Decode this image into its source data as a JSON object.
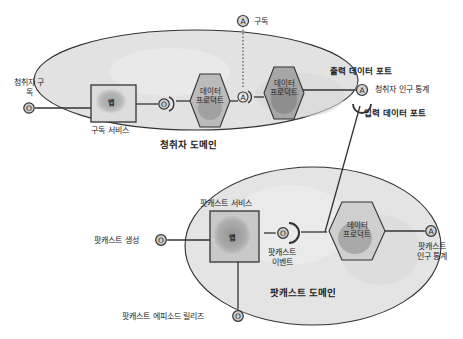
{
  "diagram": {
    "domains": [
      {
        "id": "listener",
        "label": "청취자 도메인",
        "app": {
          "label": "앱",
          "service_label": "구독 서비스"
        },
        "input_port": {
          "symbol": "O",
          "label": "청취자 구독"
        },
        "internal_port_1": {
          "symbol": "O"
        },
        "data_products": [
          {
            "line1": "데이터",
            "line2": "프로덕트"
          },
          {
            "line1": "데이터",
            "line2": "프로덕트"
          }
        ],
        "internal_port_2": {
          "symbol": "A"
        },
        "external_output": {
          "symbol": "A",
          "label": "구독"
        },
        "output_port": {
          "symbol": "A",
          "caption": "출력 데이터 포트",
          "label": "청취자 인구 통계"
        },
        "input_data_port_caption": "입력 데이터 포트"
      },
      {
        "id": "podcast",
        "label": "팟캐스트 도메인",
        "app": {
          "label": "앱",
          "service_label": "팟캐스트 서비스"
        },
        "input_port_create": {
          "symbol": "O",
          "label": "팟캐스트 생성"
        },
        "input_port_release": {
          "symbol": "O",
          "label": "팟캐스트 에피소드 릴리즈"
        },
        "event_port": {
          "symbol": "O",
          "label_line1": "팟캐스트",
          "label_line2": "이벤트"
        },
        "data_product": {
          "line1": "데이터",
          "line2": "프로덕트"
        },
        "output_port": {
          "symbol": "A",
          "label_line1": "팟캐스트",
          "label_line2": "인구 통계"
        }
      }
    ],
    "colors": {
      "domain_fill": "#e4e4e4",
      "shape_fill": "#9a9a9a",
      "stroke": "#333333",
      "port_glow": "#bdbdbd"
    }
  }
}
